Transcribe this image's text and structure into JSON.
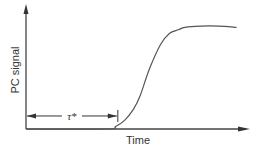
{
  "chart_data": {
    "type": "line",
    "title": "",
    "xlabel": "Time",
    "ylabel": "PC signal",
    "xlim": [
      0,
      1
    ],
    "ylim": [
      0,
      1
    ],
    "grid": false,
    "legend": "none",
    "series": [
      {
        "name": "PC signal",
        "x": [
          0,
          0.36,
          0.4,
          0.44,
          0.48,
          0.51,
          0.55,
          0.6,
          0.64,
          0.68,
          0.71,
          0.78,
          0.86,
          0.94
        ],
        "y": [
          0,
          0,
          0.02,
          0.07,
          0.16,
          0.27,
          0.48,
          0.68,
          0.77,
          0.8,
          0.82,
          0.83,
          0.83,
          0.82
        ]
      }
    ],
    "annotations": [
      {
        "type": "interval",
        "label": "τ*",
        "from": 0,
        "to": 0.41,
        "y_level": 0.105
      }
    ]
  }
}
